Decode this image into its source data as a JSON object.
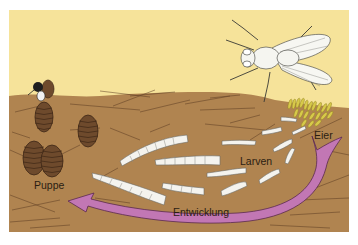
{
  "figure": {
    "colors": {
      "background": "#ffffff",
      "sky": "#f6e39a",
      "soil": "#b08450",
      "soil_dark": "#9a6e3e",
      "soil_lines": "#5a3a22",
      "pupa": "#6e4a2c",
      "pupa_dark": "#3e2716",
      "larva": "#f4f3ee",
      "egg": "#d7c94a",
      "arrow": "#c277b4",
      "arrow_outline": "#5b2a4f",
      "fly_body": "#f5f5f0",
      "text": "#2b1d12"
    },
    "labels": {
      "eggs": "Eier",
      "larvae": "Larven",
      "pupa": "Puppe",
      "development": "Entwicklung"
    },
    "stages": [
      {
        "name": "adult-fly",
        "description": "Stubenfliege sitzt auf dem Boden"
      },
      {
        "name": "eggs",
        "label": "Eier"
      },
      {
        "name": "larvae",
        "label": "Larven",
        "count": 11
      },
      {
        "name": "pupa",
        "label": "Puppe",
        "count": 5
      },
      {
        "name": "hatching-fly",
        "description": "Fliege schlüpft aus der Puppe"
      }
    ],
    "arrow": {
      "label": "Entwicklung",
      "direction": "from eggs to pupa"
    }
  }
}
